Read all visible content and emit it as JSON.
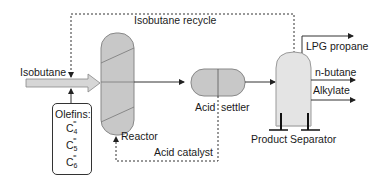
{
  "diagram": {
    "colors": {
      "vessel_fill": "#c8c8c8",
      "separator_fill": "#e4e4e4",
      "feed_arrow_fill": "#d6d6d6",
      "line": "#333333"
    },
    "labels": {
      "isobutane_recycle": "Isobutane recycle",
      "isobutane_feed": "Isobutane",
      "reactor": "Reactor",
      "acid_catalyst": "Acid catalyst",
      "acid_settler_left": "Acid",
      "acid_settler_right": "settler",
      "product_separator": "Product Separator",
      "lpg_propane": "LPG propane",
      "n_butane": "n-butane",
      "alkylate": "Alkylate"
    },
    "olefins": {
      "title": "Olefins:",
      "items": [
        {
          "base": "C",
          "sub": "4",
          "bond": "="
        },
        {
          "base": "C",
          "sub": "5",
          "bond": "="
        },
        {
          "base": "C",
          "sub": "6",
          "bond": "="
        }
      ]
    },
    "nodes": [
      "Isobutane feed",
      "Olefins feed",
      "Reactor",
      "Acid settler",
      "Product Separator"
    ],
    "edges": [
      {
        "from": "Isobutane feed",
        "to": "Reactor",
        "style": "solid-block-arrow"
      },
      {
        "from": "Olefins feed",
        "to": "Isobutane feed",
        "style": "solid"
      },
      {
        "from": "Reactor",
        "to": "Acid settler",
        "style": "solid"
      },
      {
        "from": "Acid settler",
        "to": "Product Separator",
        "style": "solid"
      },
      {
        "from": "Acid settler",
        "to": "Reactor",
        "label": "Acid catalyst",
        "style": "dashed"
      },
      {
        "from": "Product Separator",
        "to": "Isobutane feed",
        "label": "Isobutane recycle",
        "style": "dashed"
      },
      {
        "from": "Product Separator",
        "to": "LPG propane",
        "style": "solid"
      },
      {
        "from": "Product Separator",
        "to": "n-butane",
        "style": "solid"
      },
      {
        "from": "Product Separator",
        "to": "Alkylate",
        "style": "solid"
      }
    ]
  }
}
